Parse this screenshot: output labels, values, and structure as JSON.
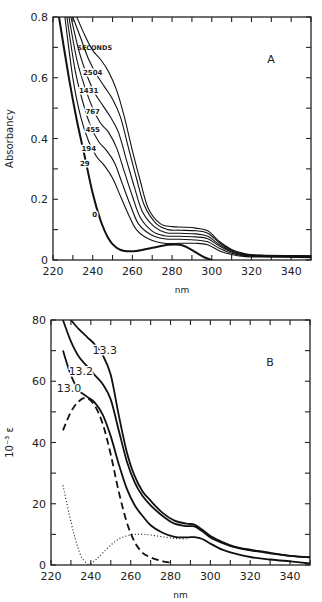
{
  "chart_data": [
    {
      "panel": "A",
      "type": "line",
      "title": "",
      "panel_label": "A",
      "xlabel": "nm",
      "ylabel": "Absorbancy",
      "xlim": [
        220,
        350
      ],
      "ylim": [
        0,
        0.8
      ],
      "xticks": [
        220,
        240,
        260,
        280,
        300,
        320,
        340
      ],
      "yticks": [
        0,
        0.2,
        0.4,
        0.6,
        0.8
      ],
      "ytick_labels": [
        "0",
        "0.2",
        "0.4",
        "0.6",
        "0.8"
      ],
      "grid": false,
      "legend_title": "SECONDS",
      "series": [
        {
          "name": "0",
          "label_at": [
            241,
            0.15
          ],
          "style": "bold",
          "x": [
            223,
            228,
            232,
            236,
            240,
            244,
            248,
            252,
            256,
            262,
            270,
            278,
            284,
            288,
            292,
            296,
            300
          ],
          "y": [
            0.8,
            0.6,
            0.46,
            0.34,
            0.22,
            0.13,
            0.07,
            0.04,
            0.03,
            0.03,
            0.04,
            0.05,
            0.05,
            0.04,
            0.025,
            0.01,
            0.0
          ]
        },
        {
          "name": "29",
          "label_at": [
            236,
            0.32
          ],
          "x": [
            226,
            230,
            234,
            238,
            242,
            246,
            250,
            254,
            258,
            262,
            268,
            276,
            284,
            292,
            298,
            304,
            310,
            316,
            324,
            350
          ],
          "y": [
            0.8,
            0.6,
            0.47,
            0.39,
            0.34,
            0.31,
            0.27,
            0.21,
            0.15,
            0.1,
            0.07,
            0.055,
            0.055,
            0.055,
            0.05,
            0.03,
            0.018,
            0.012,
            0.01,
            0.008
          ]
        },
        {
          "name": "194",
          "label_at": [
            238,
            0.37
          ],
          "x": [
            227,
            231,
            235,
            239,
            243,
            247,
            251,
            255,
            259,
            263,
            269,
            276,
            284,
            292,
            298,
            304,
            310,
            316,
            324,
            350
          ],
          "y": [
            0.8,
            0.63,
            0.52,
            0.44,
            0.39,
            0.36,
            0.32,
            0.25,
            0.18,
            0.12,
            0.085,
            0.07,
            0.068,
            0.066,
            0.06,
            0.038,
            0.022,
            0.014,
            0.012,
            0.01
          ]
        },
        {
          "name": "455",
          "label_at": [
            240,
            0.43
          ],
          "x": [
            228,
            232,
            236,
            240,
            244,
            248,
            252,
            256,
            260,
            264,
            270,
            276,
            284,
            292,
            298,
            304,
            310,
            316,
            324,
            350
          ],
          "y": [
            0.8,
            0.66,
            0.57,
            0.5,
            0.45,
            0.42,
            0.37,
            0.29,
            0.21,
            0.14,
            0.095,
            0.08,
            0.078,
            0.076,
            0.07,
            0.045,
            0.026,
            0.016,
            0.013,
            0.011
          ]
        },
        {
          "name": "767",
          "label_at": [
            240,
            0.49
          ],
          "x": [
            229,
            233,
            237,
            241,
            245,
            249,
            253,
            257,
            261,
            265,
            271,
            277,
            284,
            292,
            298,
            304,
            310,
            316,
            324,
            350
          ],
          "y": [
            0.8,
            0.69,
            0.61,
            0.55,
            0.51,
            0.47,
            0.42,
            0.33,
            0.24,
            0.16,
            0.11,
            0.09,
            0.088,
            0.086,
            0.078,
            0.05,
            0.029,
            0.018,
            0.014,
            0.012
          ]
        },
        {
          "name": "1431",
          "label_at": [
            238,
            0.56
          ],
          "x": [
            230,
            234,
            238,
            242,
            246,
            250,
            254,
            258,
            262,
            266,
            272,
            278,
            284,
            292,
            298,
            304,
            310,
            316,
            324,
            350
          ],
          "y": [
            0.8,
            0.73,
            0.66,
            0.61,
            0.57,
            0.53,
            0.47,
            0.37,
            0.27,
            0.18,
            0.12,
            0.1,
            0.098,
            0.096,
            0.088,
            0.056,
            0.032,
            0.02,
            0.015,
            0.013
          ]
        },
        {
          "name": "2504",
          "label_at": [
            240,
            0.62
          ],
          "x": [
            232,
            236,
            240,
            244,
            248,
            252,
            256,
            260,
            264,
            268,
            274,
            280,
            286,
            292,
            298,
            304,
            310,
            316,
            324,
            350
          ],
          "y": [
            0.8,
            0.74,
            0.69,
            0.66,
            0.62,
            0.56,
            0.47,
            0.36,
            0.26,
            0.17,
            0.12,
            0.11,
            0.108,
            0.105,
            0.096,
            0.06,
            0.035,
            0.022,
            0.016,
            0.014
          ]
        }
      ]
    },
    {
      "panel": "B",
      "type": "line",
      "title": "",
      "panel_label": "B",
      "xlabel": "nm",
      "ylabel": "10⁻³ ε",
      "xlim": [
        220,
        350
      ],
      "ylim": [
        0,
        80
      ],
      "xticks": [
        220,
        240,
        260,
        280,
        300,
        320,
        340
      ],
      "yticks": [
        0,
        20,
        40,
        60,
        80
      ],
      "ytick_labels": [
        "0",
        "20",
        "40",
        "60",
        "80"
      ],
      "grid": false,
      "series": [
        {
          "name": "13.3",
          "style": "solid",
          "label_at": [
            247,
            70
          ],
          "x": [
            230,
            234,
            238,
            242,
            246,
            250,
            254,
            258,
            262,
            266,
            270,
            276,
            282,
            288,
            292,
            296,
            300,
            306,
            312,
            320,
            330,
            340,
            350
          ],
          "y": [
            80,
            77,
            74.5,
            72,
            68.5,
            62,
            49,
            37,
            29,
            24,
            21,
            17,
            14.5,
            13.5,
            13.2,
            11.5,
            9.5,
            7.5,
            6,
            5,
            4,
            3,
            2.5
          ]
        },
        {
          "name": "13.2",
          "style": "solid",
          "label_at": [
            235,
            63
          ],
          "x": [
            226,
            230,
            234,
            238,
            242,
            246,
            250,
            254,
            258,
            262,
            266,
            270,
            276,
            282,
            288,
            292,
            296,
            300,
            306,
            312,
            320,
            330,
            340,
            350
          ],
          "y": [
            80,
            73,
            68,
            65,
            62,
            59,
            54,
            44,
            34,
            27,
            22.5,
            19.5,
            16,
            13.5,
            12.7,
            12.6,
            11,
            9,
            7.2,
            5.8,
            4.8,
            3.8,
            3,
            2.5
          ]
        },
        {
          "name": "13.0",
          "style": "solid",
          "label_at": [
            229,
            57.5
          ],
          "x": [
            226,
            230,
            234,
            238,
            242,
            246,
            250,
            254,
            258,
            262,
            266,
            270,
            276,
            282,
            288,
            292,
            296,
            300,
            306,
            312,
            320,
            330,
            340,
            350
          ],
          "y": [
            70,
            62,
            57,
            55,
            53,
            49,
            42,
            33,
            25,
            19.5,
            16,
            13,
            10.5,
            9.2,
            9,
            9.1,
            8.5,
            7,
            5,
            3.8,
            2.6,
            1.8,
            1.2,
            0.5
          ]
        },
        {
          "name": "dashed",
          "style": "dashed",
          "x": [
            226,
            230,
            234,
            238,
            242,
            246,
            250,
            254,
            258,
            262,
            266,
            270,
            276,
            280
          ],
          "y": [
            44,
            50,
            53.5,
            54.5,
            52,
            46,
            36,
            24,
            14,
            7.5,
            4,
            2.5,
            1.2,
            0.8
          ]
        },
        {
          "name": "dotted",
          "style": "dotted",
          "x": [
            226,
            229,
            232,
            235,
            238,
            240,
            243,
            246,
            250,
            254,
            258,
            262,
            266,
            270,
            276,
            282,
            288
          ],
          "y": [
            26,
            17,
            9,
            3,
            0.5,
            0.5,
            2,
            4,
            6.5,
            8.5,
            9.5,
            10,
            10,
            9.8,
            9.2,
            8.7,
            8.5
          ]
        }
      ]
    }
  ],
  "figure": {
    "panels": [
      {
        "id": "A",
        "plot_box": {
          "left": 53,
          "top": 17,
          "right": 311,
          "bottom": 260
        }
      },
      {
        "id": "B",
        "plot_box": {
          "left": 51,
          "top": 320,
          "right": 310,
          "bottom": 565
        }
      }
    ]
  }
}
